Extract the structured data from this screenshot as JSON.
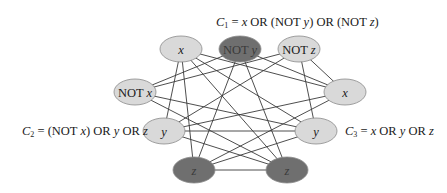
{
  "diagram": {
    "type": "3-SAT to clique reduction graph",
    "clauses": [
      {
        "id": "C1",
        "label_var": "C",
        "label_sub": "1",
        "label_rest": " = x OR (NOT y) OR (NOT z)",
        "literals": [
          {
            "id": "c1_x",
            "text": "x",
            "italic": true,
            "shaded": false,
            "cx": 181,
            "cy": 49
          },
          {
            "id": "c1_noty",
            "text": "NOT y",
            "italic": false,
            "shaded": true,
            "cx": 240,
            "cy": 49
          },
          {
            "id": "c1_notz",
            "text": "NOT z",
            "italic": false,
            "shaded": false,
            "cx": 299,
            "cy": 49
          }
        ]
      },
      {
        "id": "C2",
        "label_var": "C",
        "label_sub": "2",
        "label_rest": " = (NOT x) OR y OR z",
        "literals": [
          {
            "id": "c2_notx",
            "text": "NOT x",
            "italic": false,
            "shaded": false,
            "cx": 135,
            "cy": 92
          },
          {
            "id": "c2_y",
            "text": "y",
            "italic": true,
            "shaded": false,
            "cx": 164,
            "cy": 131
          },
          {
            "id": "c2_z",
            "text": "z",
            "italic": true,
            "shaded": true,
            "cx": 194,
            "cy": 170
          }
        ]
      },
      {
        "id": "C3",
        "label_var": "C",
        "label_sub": "3",
        "label_rest": " = x OR y OR z",
        "literals": [
          {
            "id": "c3_x",
            "text": "x",
            "italic": true,
            "shaded": false,
            "cx": 345,
            "cy": 92
          },
          {
            "id": "c3_y",
            "text": "y",
            "italic": true,
            "shaded": false,
            "cx": 316,
            "cy": 131
          },
          {
            "id": "c3_z",
            "text": "z",
            "italic": true,
            "shaded": true,
            "cx": 287,
            "cy": 170
          }
        ]
      }
    ],
    "edges": [
      [
        "c1_x",
        "c2_y"
      ],
      [
        "c1_x",
        "c2_z"
      ],
      [
        "c1_noty",
        "c2_notx"
      ],
      [
        "c1_noty",
        "c2_z"
      ],
      [
        "c1_notz",
        "c2_notx"
      ],
      [
        "c1_notz",
        "c2_y"
      ],
      [
        "c1_x",
        "c3_x"
      ],
      [
        "c1_x",
        "c3_y"
      ],
      [
        "c1_x",
        "c3_z"
      ],
      [
        "c1_noty",
        "c3_x"
      ],
      [
        "c1_noty",
        "c3_z"
      ],
      [
        "c1_notz",
        "c3_x"
      ],
      [
        "c1_notz",
        "c3_y"
      ],
      [
        "c2_notx",
        "c3_y"
      ],
      [
        "c2_notx",
        "c3_z"
      ],
      [
        "c2_y",
        "c3_x"
      ],
      [
        "c2_y",
        "c3_y"
      ],
      [
        "c2_y",
        "c3_z"
      ],
      [
        "c2_z",
        "c3_x"
      ],
      [
        "c2_z",
        "c3_y"
      ],
      [
        "c2_z",
        "c3_z"
      ]
    ],
    "node_rx": 21,
    "node_ry": 13
  },
  "colors": {
    "node_light_fill": "#d9d9d9",
    "node_dark_fill": "#6f6f6f",
    "node_stroke": "#8a8a8a",
    "edge": "#3a3a3a",
    "text": "#1a1a1a",
    "dark_node_text": "#3a3a3a"
  }
}
